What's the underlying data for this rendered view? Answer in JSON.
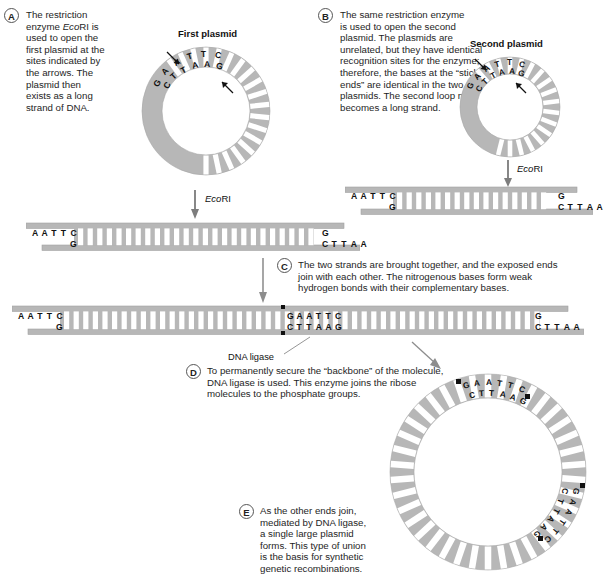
{
  "figure": {
    "colors": {
      "dna_fill": "#b7b7b7",
      "dna_stroke": "#9a9a9a",
      "rung": "#ffffff",
      "text": "#1a1a1a",
      "ligase_mark": "#111111"
    }
  },
  "panels": [
    {
      "id": "A",
      "label": "A",
      "text": "The restriction enzyme EcoRI is used to open the first plasmid at the sites indicated by the arrows. The plasmid then exists as a long strand of DNA.",
      "lines": [
        "The restriction",
        "enzyme EcoRI is",
        "used to open the",
        "first plasmid at the",
        "sites indicated by",
        "the arrows. The",
        "plasmid then",
        "exists as a long",
        "strand of DNA."
      ]
    },
    {
      "id": "B",
      "label": "B",
      "text": "The same restriction enzyme is used to open the second plasmid. The plasmids are unrelated, but they have identical recognition sites for the enzyme; therefore, the bases at the “sticky ends” are identical in the two plasmids. The second loop now becomes a long strand.",
      "lines": [
        "The same restriction enzyme",
        "is used to open the second",
        "plasmid. The plasmids are",
        "unrelated, but they have identical",
        "recognition sites for the enzyme;",
        "therefore, the bases at the “sticky",
        "ends” are identical in the two",
        "plasmids. The second loop now",
        "becomes a long strand."
      ]
    },
    {
      "id": "C",
      "label": "C",
      "text": "The two strands are brought together, and the exposed ends join with each other. The nitrogenous bases form weak hydrogen bonds with their complementary bases.",
      "lines": [
        "The two strands are brought together, and the exposed ends",
        "join with each other. The nitrogenous bases form weak",
        "hydrogen bonds with their complementary bases."
      ]
    },
    {
      "id": "D",
      "label": "D",
      "text": "To permanently secure the “backbone” of the molecule, DNA ligase is used. This enzyme joins the ribose molecules to the phosphate groups.",
      "lines": [
        "To permanently secure the “backbone” of the molecule,",
        "DNA ligase is used. This enzyme joins the ribose",
        "molecules to the phosphate groups."
      ]
    },
    {
      "id": "E",
      "label": "E",
      "text": "As the other ends join, mediated by DNA ligase, a single large plasmid forms. This type of union is the basis for synthetic genetic recombinations.",
      "lines": [
        "As the other ends join,",
        "mediated by DNA ligase,",
        "a single large plasmid",
        "forms. This type of union",
        "is the basis for synthetic",
        "genetic recombinations."
      ]
    }
  ],
  "captions": {
    "first_plasmid": "First plasmid",
    "second_plasmid": "Second plasmid",
    "dna_ligase": "DNA ligase"
  },
  "enzyme": {
    "name": "EcoRI",
    "name_italic_part": "Eco",
    "name_roman_part": "RI"
  },
  "sequences": {
    "recognition_top": "GAATTC",
    "recognition_bottom": "CTTAAG",
    "sticky_left_top": "AATTC",
    "sticky_left_bottom": "G",
    "sticky_right_top": "G",
    "sticky_right_bottom": "CTTAA",
    "junction_top": "GAATTC",
    "junction_bottom": "CTTAAG"
  },
  "plasmid_circle_1": {
    "caption": "First plasmid",
    "top_bases": [
      "G",
      "A",
      "A",
      "T",
      "T",
      "C"
    ],
    "bottom_bases": [
      "C",
      "T",
      "T",
      "A",
      "A",
      "G"
    ],
    "arrow_count": 2
  },
  "plasmid_circle_2": {
    "caption": "Second plasmid",
    "top_bases": [
      "G",
      "A",
      "A",
      "T",
      "T",
      "C"
    ],
    "bottom_bases": [
      "C",
      "T",
      "T",
      "A",
      "A",
      "G"
    ],
    "arrow_count": 2
  },
  "final_plasmid": {
    "site_top_outer": [
      "G",
      "A",
      "A",
      "T",
      "T",
      "C"
    ],
    "site_top_inner": [
      "C",
      "T",
      "T",
      "A",
      "A",
      "G"
    ],
    "site_right_outer": [
      "G",
      "A",
      "A",
      "T",
      "T",
      "C"
    ],
    "site_right_inner": [
      "C",
      "T",
      "T",
      "A",
      "A",
      "G"
    ],
    "ligase_marks": 4
  },
  "strands": {
    "strand_1_left_top": [
      "A",
      "A",
      "T",
      "T",
      "C"
    ],
    "strand_1_left_bottom": [
      "G"
    ],
    "strand_1_right_top": [
      "G"
    ],
    "strand_1_right_bottom": [
      "C",
      "T",
      "T",
      "A",
      "A"
    ],
    "strand_2_left_top": [
      "A",
      "A",
      "T",
      "T",
      "C"
    ],
    "strand_2_left_bottom": [
      "G"
    ],
    "strand_2_right_top": [
      "G"
    ],
    "strand_2_right_bottom": [
      "C",
      "T",
      "T",
      "A",
      "A"
    ],
    "joined_left_top": [
      "A",
      "A",
      "T",
      "T",
      "C"
    ],
    "joined_left_bottom": [
      "G"
    ],
    "joined_mid_top": [
      "G",
      "A",
      "A",
      "T",
      "T",
      "C"
    ],
    "joined_mid_bottom": [
      "C",
      "T",
      "T",
      "A",
      "A",
      "G"
    ],
    "joined_right_top": [
      "G"
    ],
    "joined_right_bottom": [
      "C",
      "T",
      "T",
      "A",
      "A"
    ]
  }
}
